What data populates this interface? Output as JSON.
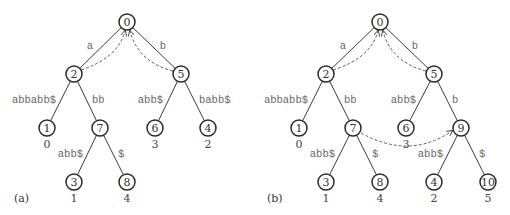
{
  "figure": {
    "panels": [
      {
        "id": "a",
        "label": "(a)",
        "label_pos": [
          14,
          198
        ],
        "nodes": [
          {
            "id": "0",
            "x": 127,
            "y": 22
          },
          {
            "id": "2",
            "x": 74,
            "y": 74
          },
          {
            "id": "5",
            "x": 181,
            "y": 74
          },
          {
            "id": "1",
            "x": 47,
            "y": 128,
            "leaf": "0"
          },
          {
            "id": "7",
            "x": 100,
            "y": 128
          },
          {
            "id": "6",
            "x": 155,
            "y": 128,
            "leaf": "3"
          },
          {
            "id": "4",
            "x": 208,
            "y": 128,
            "leaf": "2"
          },
          {
            "id": "3",
            "x": 74,
            "y": 182,
            "leaf": "1"
          },
          {
            "id": "8",
            "x": 127,
            "y": 182,
            "leaf": "4"
          }
        ],
        "edges": [
          {
            "from": "0",
            "to": "2",
            "label": "a",
            "lx": 90,
            "ly": 46,
            "anchor": "middle"
          },
          {
            "from": "0",
            "to": "5",
            "label": "b",
            "lx": 163,
            "ly": 46,
            "anchor": "middle"
          },
          {
            "from": "2",
            "to": "1",
            "label": "abbabb$",
            "lx": 56,
            "ly": 100,
            "anchor": "end"
          },
          {
            "from": "2",
            "to": "7",
            "label": "bb",
            "lx": 92,
            "ly": 100,
            "anchor": "start"
          },
          {
            "from": "5",
            "to": "6",
            "label": "abb$",
            "lx": 163,
            "ly": 100,
            "anchor": "end"
          },
          {
            "from": "5",
            "to": "4",
            "label": "babb$",
            "lx": 199,
            "ly": 100,
            "anchor": "start"
          },
          {
            "from": "7",
            "to": "3",
            "label": "abb$",
            "lx": 83,
            "ly": 154,
            "anchor": "end"
          },
          {
            "from": "7",
            "to": "8",
            "label": "$",
            "lx": 118,
            "ly": 154,
            "anchor": "start"
          }
        ],
        "suffix_links": [
          {
            "from": "2",
            "to": "0",
            "path": "M 81 70 Q 118 58 125 31"
          },
          {
            "from": "5",
            "to": "0",
            "path": "M 173 71 Q 138 62 130 31"
          }
        ]
      },
      {
        "id": "b",
        "label": "(b)",
        "label_pos": [
          267,
          198
        ],
        "nodes": [
          {
            "id": "0",
            "x": 380,
            "y": 22
          },
          {
            "id": "2",
            "x": 326,
            "y": 74
          },
          {
            "id": "5",
            "x": 434,
            "y": 74
          },
          {
            "id": "1",
            "x": 299,
            "y": 128,
            "leaf": "0"
          },
          {
            "id": "7",
            "x": 353,
            "y": 128
          },
          {
            "id": "6",
            "x": 406,
            "y": 128,
            "leaf": "3"
          },
          {
            "id": "9",
            "x": 461,
            "y": 128
          },
          {
            "id": "3",
            "x": 326,
            "y": 182,
            "leaf": "1"
          },
          {
            "id": "8",
            "x": 380,
            "y": 182,
            "leaf": "4"
          },
          {
            "id": "4",
            "x": 434,
            "y": 182,
            "leaf": "2"
          },
          {
            "id": "10",
            "x": 488,
            "y": 182,
            "leaf": "5"
          }
        ],
        "edges": [
          {
            "from": "0",
            "to": "2",
            "label": "a",
            "lx": 343,
            "ly": 46,
            "anchor": "middle"
          },
          {
            "from": "0",
            "to": "5",
            "label": "b",
            "lx": 415,
            "ly": 46,
            "anchor": "middle"
          },
          {
            "from": "2",
            "to": "1",
            "label": "abbabb$",
            "lx": 308,
            "ly": 100,
            "anchor": "end"
          },
          {
            "from": "2",
            "to": "7",
            "label": "bb",
            "lx": 344,
            "ly": 100,
            "anchor": "start"
          },
          {
            "from": "5",
            "to": "6",
            "label": "abb$",
            "lx": 416,
            "ly": 100,
            "anchor": "end"
          },
          {
            "from": "5",
            "to": "9",
            "label": "b",
            "lx": 452,
            "ly": 100,
            "anchor": "start"
          },
          {
            "from": "7",
            "to": "3",
            "label": "abb$",
            "lx": 335,
            "ly": 154,
            "anchor": "end"
          },
          {
            "from": "7",
            "to": "8",
            "label": "$",
            "lx": 372,
            "ly": 154,
            "anchor": "start"
          },
          {
            "from": "9",
            "to": "4",
            "label": "abb$",
            "lx": 443,
            "ly": 154,
            "anchor": "end"
          },
          {
            "from": "9",
            "to": "10",
            "label": "$",
            "lx": 479,
            "ly": 154,
            "anchor": "start"
          }
        ],
        "suffix_links": [
          {
            "from": "2",
            "to": "0",
            "path": "M 333 70 Q 371 58 378 31"
          },
          {
            "from": "5",
            "to": "0",
            "path": "M 426 71 Q 391 62 383 31"
          },
          {
            "from": "7",
            "to": "9",
            "path": "M 361 133 Q 410 160 452 131"
          }
        ]
      }
    ]
  }
}
